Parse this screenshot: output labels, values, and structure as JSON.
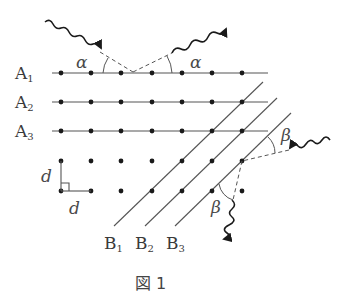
{
  "figure": {
    "caption": "図 1",
    "row_labels": [
      {
        "base": "A",
        "sub": "1"
      },
      {
        "base": "A",
        "sub": "2"
      },
      {
        "base": "A",
        "sub": "3"
      }
    ],
    "plane_labels": [
      {
        "base": "B",
        "sub": "1"
      },
      {
        "base": "B",
        "sub": "2"
      },
      {
        "base": "B",
        "sub": "3"
      }
    ],
    "spacing_labels": {
      "vertical": "d",
      "horizontal": "d"
    },
    "angles": {
      "incident_A": "α",
      "reflected_A": "α",
      "incident_B": "β",
      "reflected_B": "β"
    },
    "lattice": {
      "columns_x": [
        61,
        91,
        121,
        152,
        182,
        212,
        242
      ],
      "rows_y": [
        73,
        102,
        131,
        161,
        191
      ],
      "spacing_px": 30
    },
    "colors": {
      "line": "#555555",
      "dot": "#1a1a1a",
      "text": "#3a3a3a"
    }
  }
}
